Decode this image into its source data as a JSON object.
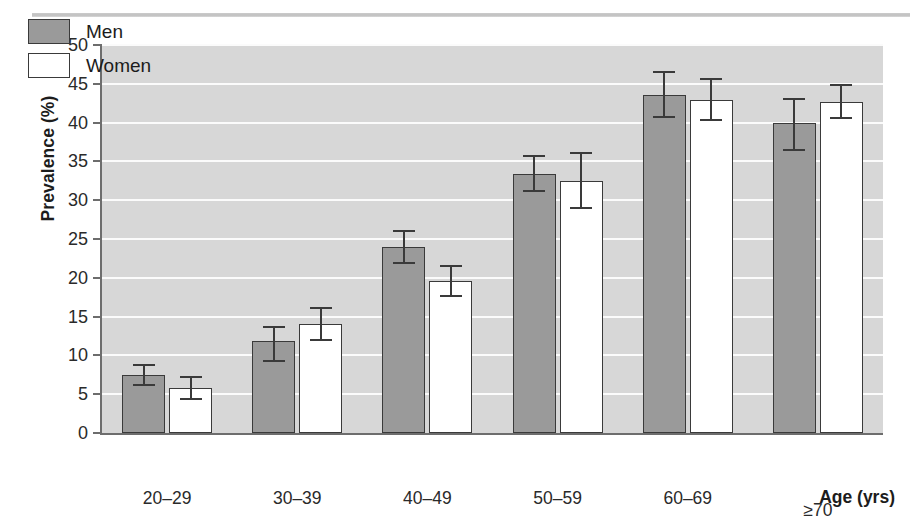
{
  "chart_data": {
    "type": "bar",
    "title": "",
    "xlabel": "Age (yrs)",
    "ylabel": "Prevalence (%)",
    "ylim": [
      0,
      50
    ],
    "ytick_step": 5,
    "yticks": [
      0,
      5,
      10,
      15,
      20,
      25,
      30,
      35,
      40,
      45,
      50
    ],
    "ytick_labels": [
      "0",
      "5",
      "10",
      "15",
      "20",
      "25",
      "30",
      "35",
      "40",
      "45",
      "50"
    ],
    "categories": [
      "20–29",
      "30–39",
      "40–49",
      "50–59",
      "60–69",
      "≥70"
    ],
    "grid": "horizontal-white",
    "legend_position": "top-left-inside",
    "series": [
      {
        "name": "Men",
        "fill": "#9a9a9a",
        "values": [
          7.5,
          11.8,
          24.0,
          33.4,
          43.6,
          40.0
        ],
        "err_low": [
          1.4,
          2.7,
          2.2,
          2.4,
          3.0,
          3.6
        ],
        "err_high": [
          1.4,
          2.0,
          2.1,
          2.4,
          3.0,
          3.2
        ]
      },
      {
        "name": "Women",
        "fill": "#ffffff",
        "values": [
          5.8,
          14.1,
          19.6,
          32.5,
          42.9,
          42.6
        ],
        "err_low": [
          1.5,
          2.2,
          2.1,
          3.6,
          2.7,
          2.2
        ],
        "err_high": [
          1.6,
          2.1,
          2.1,
          3.7,
          2.8,
          2.4
        ]
      }
    ]
  },
  "legend": {
    "items": [
      {
        "label": "Men",
        "swatch": "men"
      },
      {
        "label": "Women",
        "swatch": "women"
      }
    ]
  },
  "colors": {
    "plot_background": "#d7d7d7",
    "gridline": "#fbfbfb",
    "axis": "#6d6d6d",
    "bar_men": "#9a9a9a",
    "bar_women": "#ffffff",
    "bar_outline": "#3a3a3a",
    "text": "#1c1c1c",
    "top_rule": "#c9c9c9"
  }
}
